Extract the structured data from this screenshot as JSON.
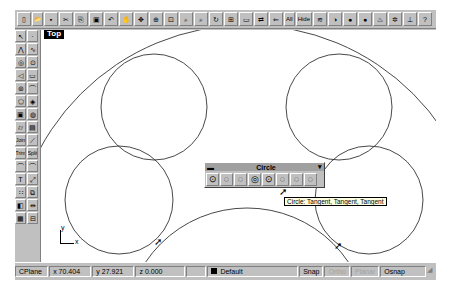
{
  "viewport": {
    "name": "Top",
    "axis": {
      "x": "x",
      "y": "y"
    }
  },
  "top_toolbar": {
    "buttons": [
      {
        "name": "new-icon",
        "glyph": "▯"
      },
      {
        "name": "open-icon",
        "glyph": "📂"
      },
      {
        "name": "save-icon",
        "glyph": "▪"
      },
      {
        "name": "cut-icon",
        "glyph": "✂"
      },
      {
        "name": "copy-icon",
        "glyph": "⎘"
      },
      {
        "name": "paste-icon",
        "glyph": "▣"
      },
      {
        "name": "undo-icon",
        "glyph": "↶"
      },
      {
        "name": "pan-hand-icon",
        "glyph": "✋"
      },
      {
        "name": "rotate-view-icon",
        "glyph": "✥"
      },
      {
        "name": "zoom-dynamic-icon",
        "glyph": "⊕"
      },
      {
        "name": "zoom-window-icon",
        "glyph": "⊡"
      },
      {
        "name": "zoom-target-icon",
        "glyph": "⌕"
      },
      {
        "name": "zoom-extents-icon",
        "glyph": "⌕"
      },
      {
        "name": "zoom-all-icon",
        "glyph": "↻"
      },
      {
        "name": "four-viewports-icon",
        "glyph": "⊞"
      },
      {
        "name": "grid-icon",
        "glyph": "▭"
      },
      {
        "name": "lock-icon",
        "glyph": "⇄"
      },
      {
        "name": "layer-icon",
        "glyph": "⇐"
      },
      {
        "name": "show-all-label",
        "glyph": "All"
      },
      {
        "name": "hide-label",
        "glyph": "Hide"
      },
      {
        "name": "layers-icon",
        "glyph": "≋"
      },
      {
        "name": "shaded-icon",
        "glyph": "◑"
      },
      {
        "name": "render-icon",
        "glyph": "●"
      },
      {
        "name": "render-preview-icon",
        "glyph": "●"
      },
      {
        "name": "light-icon",
        "glyph": "♨"
      },
      {
        "name": "options-gear-icon",
        "glyph": "✲"
      },
      {
        "name": "dimension-icon",
        "glyph": "⊥"
      },
      {
        "name": "help-icon",
        "glyph": "?"
      }
    ]
  },
  "left_toolbar": {
    "rows": [
      [
        "select-arrow-icon:↖",
        "point-icon:·"
      ],
      [
        "polyline-icon:⋀",
        "curve-icon:∿"
      ],
      [
        "circle-icon:◎",
        "circle-alt-icon:⊙"
      ],
      [
        "arc-icon:◁",
        "rectangle-icon:▭"
      ],
      [
        "ellipse-icon:⊚",
        "fillet-curve-icon:⌒"
      ],
      [
        "polygon-icon:⬠",
        "surface-icon:◈"
      ],
      [
        "box-icon:▣",
        "sphere-icon:◍"
      ],
      [
        "cylinder-icon:⌭",
        "solid-icon:▤"
      ],
      [
        "join-label:Join",
        "extend-icon:⟋"
      ],
      [
        "trim-label:Trim",
        "split-label:Split"
      ],
      [
        "blend-icon:⌒",
        "offset-icon:⌒"
      ],
      [
        "text-icon:T",
        "scale-icon:⤢"
      ],
      [
        "array-icon:∷",
        "transform-icon:⧉"
      ],
      [
        "boolean-icon:◧",
        "mirror-icon:⇹"
      ],
      [
        "grid-array-icon:▦",
        "dimension-grid-icon:⊟"
      ]
    ]
  },
  "circle_toolbar": {
    "title": "Circle",
    "buttons": [
      {
        "name": "circle-center-radius-icon",
        "glyph": "⊙"
      },
      {
        "name": "circle-diameter-icon",
        "glyph": "◌"
      },
      {
        "name": "circle-3point-icon",
        "glyph": "◌"
      },
      {
        "name": "circle-tangent-tangent-radius-icon",
        "glyph": "◎"
      },
      {
        "name": "circle-around-curve-icon",
        "glyph": "⊙"
      },
      {
        "name": "circle-tangent-tangent-tangent-icon",
        "glyph": "◌"
      },
      {
        "name": "circle-fit-points-icon",
        "glyph": "◌"
      },
      {
        "name": "circle-vertical-icon",
        "glyph": "◌"
      }
    ],
    "tooltip": "Circle: Tangent, Tangent, Tangent"
  },
  "status_bar": {
    "cplane": "CPlane",
    "x": "x 70.404",
    "y": "y 27.921",
    "z": "z 0.000",
    "layer": "Default",
    "layer_color": "#000000",
    "snap": "Snap",
    "ortho": "Ortho",
    "planar": "Planar",
    "osnap": "Osnap"
  },
  "geometry": {
    "circles": [
      {
        "cx": 113,
        "cy": 77,
        "r": 53
      },
      {
        "cx": 298,
        "cy": 77,
        "r": 53
      },
      {
        "cx": 78,
        "cy": 170,
        "r": 54
      },
      {
        "cx": 328,
        "cy": 170,
        "r": 54
      }
    ],
    "big_arc": {
      "cx": 206,
      "cy": 230,
      "r": 235
    },
    "bottom_arc": {
      "cx": 206,
      "cy": 300,
      "r": 122
    }
  }
}
